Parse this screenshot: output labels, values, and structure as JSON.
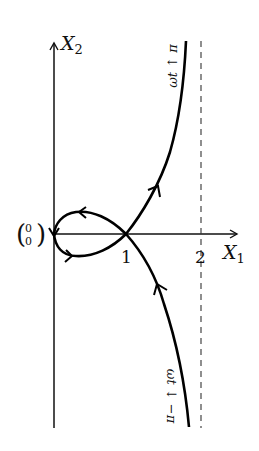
{
  "figure": {
    "type": "phase-portrait",
    "axes": {
      "x_label": "X",
      "x_label_sub": "1",
      "y_label": "X",
      "y_label_sub": "2",
      "origin_label_top": "0",
      "origin_label_bottom": "0",
      "x_ticks": [
        "1",
        "2"
      ]
    },
    "asymptote": {
      "x": 2,
      "style": "dashed"
    },
    "annotations": {
      "upper_branch": "ωt ↑ π",
      "lower_branch": "ωt ↓ −π"
    },
    "curve": {
      "description": "Closed loop from origin through (1,0), with branches extending to asymptote X1 = 2",
      "crossing_point": "(1, 0)"
    },
    "colors": {
      "curve": "#000000",
      "axes": "#111111",
      "dashed": "#333333",
      "background": "#ffffff"
    }
  }
}
